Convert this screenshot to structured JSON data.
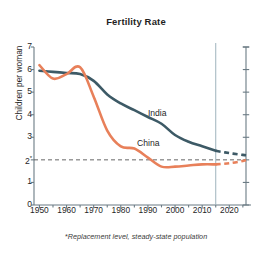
{
  "chart_data": {
    "type": "line",
    "title": "Fertility Rate",
    "xlabel": "",
    "ylabel": "Children per woman",
    "xlim": [
      1948,
      2028
    ],
    "ylim": [
      0,
      7
    ],
    "grid": false,
    "legend_position": "inline-annotations",
    "x_ticks": [
      1950,
      1960,
      1970,
      1980,
      1990,
      2000,
      2010,
      2020
    ],
    "x_minor_tick_interval": 5,
    "y_ticks": [
      0,
      1,
      2,
      3,
      4,
      5,
      6,
      7
    ],
    "y_tick_labels": [
      "0",
      "1",
      "2*",
      "3",
      "4",
      "5",
      "6",
      "7"
    ],
    "right_axis": {
      "ticks": [
        0,
        1,
        2,
        3,
        4,
        5,
        6,
        7
      ],
      "labels": []
    },
    "annotations": {
      "replacement_line_value": 2,
      "replacement_line_style": "dashed",
      "projection_divider_year": 2015,
      "footnote": "*Replacement level, steady-state population"
    },
    "series": [
      {
        "name": "India",
        "color": "#3D5A66",
        "label_x": 1990,
        "label_y": 4.05,
        "x": [
          1950,
          1955,
          1960,
          1965,
          1970,
          1975,
          1980,
          1985,
          1990,
          1995,
          2000,
          2005,
          2010,
          2015
        ],
        "values": [
          5.95,
          5.9,
          5.85,
          5.8,
          5.5,
          4.9,
          4.5,
          4.2,
          3.9,
          3.6,
          3.1,
          2.8,
          2.6,
          2.4
        ],
        "projection_x": [
          2015,
          2020,
          2025,
          2027
        ],
        "projection_values": [
          2.4,
          2.3,
          2.22,
          2.2
        ],
        "projection_style": "dashed"
      },
      {
        "name": "China",
        "color": "#E8805A",
        "label_x": 1986,
        "label_y": 2.72,
        "x": [
          1950,
          1955,
          1960,
          1965,
          1970,
          1975,
          1980,
          1985,
          1990,
          1995,
          2000,
          2005,
          2010,
          2015
        ],
        "values": [
          6.2,
          5.6,
          5.8,
          6.1,
          4.8,
          3.3,
          2.6,
          2.5,
          2.1,
          1.7,
          1.7,
          1.75,
          1.8,
          1.8
        ],
        "projection_x": [
          2015,
          2020,
          2025,
          2027
        ],
        "projection_values": [
          1.8,
          1.85,
          1.95,
          2.0
        ],
        "projection_style": "dashed"
      }
    ]
  },
  "colors": {
    "india": "#3D5A66",
    "china": "#E8805A",
    "axis": "#6b7b84",
    "divider": "#9fb3bd",
    "replacement": "#555555",
    "background": "#ffffff",
    "text": "#1f1f1f"
  }
}
